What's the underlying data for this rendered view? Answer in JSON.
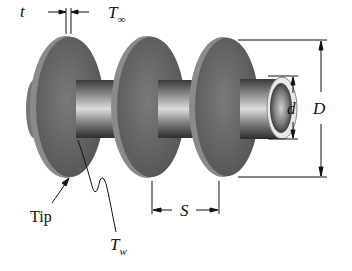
{
  "figure": {
    "labels": {
      "t": "t",
      "T_inf_main": "T",
      "T_inf_sub": "∞",
      "d": "d",
      "D": "D",
      "S": "S",
      "tip": "Tip",
      "T_w_main": "T",
      "T_w_sub": "w"
    },
    "colors": {
      "fin_face": "#6b6b6b",
      "fin_edge": "#8d8d8d",
      "tube_dark": "#3a3a3a",
      "tube_light": "#d8d8d8",
      "dimension_line": "#111111"
    },
    "components": [
      "tube",
      "fin-1",
      "fin-2",
      "fin-3",
      "tube-opening"
    ]
  }
}
